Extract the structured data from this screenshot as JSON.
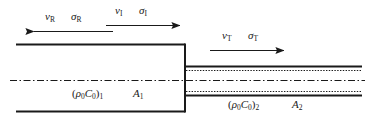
{
  "figure": {
    "name": "pipe-area-change-wave-diagram",
    "background_color": "#ffffff",
    "line_color": "#1a1a1a"
  },
  "waves": {
    "reflected": {
      "velocity_symbol": "ν",
      "velocity_subscript": "R",
      "stress_symbol": "σ",
      "stress_subscript": "R",
      "direction": "left"
    },
    "incident": {
      "velocity_symbol": "ν",
      "velocity_subscript": "I",
      "stress_symbol": "σ",
      "stress_subscript": "I",
      "direction": "right"
    },
    "transmitted": {
      "velocity_symbol": "ν",
      "velocity_subscript": "T",
      "stress_symbol": "σ",
      "stress_subscript": "T",
      "direction": "right"
    }
  },
  "sections": {
    "left": {
      "impedance_open": "(",
      "impedance_rho": "ρ",
      "impedance_rho_sub": "0",
      "impedance_c": "C",
      "impedance_c_sub": "0",
      "impedance_close": ")",
      "impedance_index": "1",
      "area_symbol": "A",
      "area_index": "1"
    },
    "right": {
      "impedance_open": "(",
      "impedance_rho": "ρ",
      "impedance_rho_sub": "0",
      "impedance_c": "C",
      "impedance_c_sub": "0",
      "impedance_close": ")",
      "impedance_index": "2",
      "area_symbol": "A",
      "area_index": "2"
    }
  }
}
